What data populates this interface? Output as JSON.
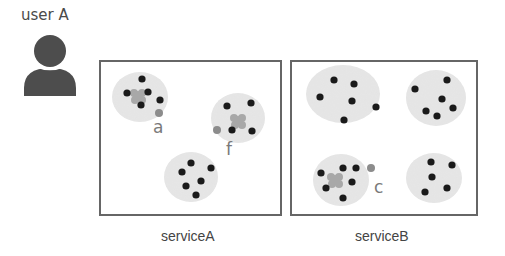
{
  "user": {
    "label": "user A",
    "icon": "person-icon",
    "color": "#4d4d4d"
  },
  "colors": {
    "box_border": "#666666",
    "cluster_fill": "#e4e4e4",
    "dot": "#1a1a1a",
    "highlight_dot": "#8c8c8c",
    "blob": "#a8a8a8",
    "label": "#7a7a7a"
  },
  "services": [
    {
      "name": "serviceA",
      "box": {
        "x": 100,
        "y": 61,
        "w": 181,
        "h": 154
      },
      "label_pos": {
        "x": 161,
        "y": 228
      },
      "clusters": [
        {
          "cx": 140,
          "cy": 97,
          "rx": 28,
          "ry": 25,
          "blob": [
            138,
            96
          ],
          "dots": [
            [
              142,
              79
            ],
            [
              127,
              93
            ],
            [
              148,
              92
            ],
            [
              141,
              105
            ],
            [
              160,
              100
            ]
          ],
          "outlier": {
            "x": 159,
            "y": 113,
            "label": "a",
            "lx": 153,
            "ly": 133
          }
        },
        {
          "cx": 238,
          "cy": 118,
          "rx": 27,
          "ry": 25,
          "blob": [
            238,
            121
          ],
          "dots": [
            [
              227,
              106
            ],
            [
              251,
              103
            ],
            [
              232,
              130
            ],
            [
              252,
              131
            ]
          ],
          "outlier": {
            "x": 217,
            "y": 130,
            "label": "f",
            "lx": 226,
            "ly": 155
          }
        },
        {
          "cx": 191,
          "cy": 177,
          "rx": 27,
          "ry": 25,
          "blob": null,
          "dots": [
            [
              191,
              163
            ],
            [
              182,
              172
            ],
            [
              211,
              168
            ],
            [
              201,
              181
            ],
            [
              186,
              186
            ],
            [
              196,
              195
            ]
          ],
          "outlier": null
        }
      ]
    },
    {
      "name": "serviceB",
      "box": {
        "x": 291,
        "y": 61,
        "w": 186,
        "h": 154
      },
      "label_pos": {
        "x": 355,
        "y": 228
      },
      "clusters": [
        {
          "cx": 343,
          "cy": 94,
          "rx": 37,
          "ry": 29,
          "blob": null,
          "dots": [
            [
              334,
              80
            ],
            [
              354,
              84
            ],
            [
              320,
              97
            ],
            [
              352,
              101
            ],
            [
              376,
              107
            ],
            [
              344,
              120
            ]
          ],
          "outlier": null
        },
        {
          "cx": 436,
          "cy": 98,
          "rx": 30,
          "ry": 28,
          "blob": null,
          "dots": [
            [
              447,
              80
            ],
            [
              415,
              89
            ],
            [
              442,
              99
            ],
            [
              426,
              111
            ],
            [
              453,
              108
            ],
            [
              437,
              116
            ]
          ],
          "outlier": null
        },
        {
          "cx": 341,
          "cy": 180,
          "rx": 28,
          "ry": 26,
          "blob": [
            335,
            180
          ],
          "dots": [
            [
              343,
              168
            ],
            [
              356,
              168
            ],
            [
              321,
              173
            ],
            [
              352,
              182
            ],
            [
              326,
              188
            ],
            [
              343,
              198
            ]
          ],
          "outlier": {
            "x": 371,
            "y": 168,
            "label": "c",
            "lx": 374,
            "ly": 193
          }
        },
        {
          "cx": 434,
          "cy": 178,
          "rx": 28,
          "ry": 25,
          "blob": null,
          "dots": [
            [
              431,
              162
            ],
            [
              452,
              165
            ],
            [
              432,
              177
            ],
            [
              425,
              192
            ],
            [
              447,
              188
            ]
          ],
          "outlier": null
        }
      ]
    }
  ]
}
